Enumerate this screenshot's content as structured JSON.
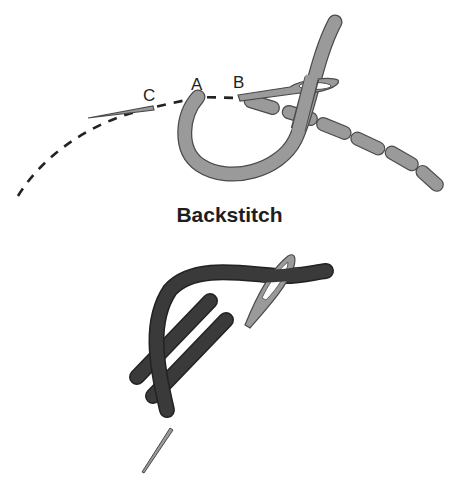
{
  "diagram": {
    "top_figure": {
      "point_labels": [
        "A",
        "B",
        "C"
      ],
      "caption": "Backstitch",
      "thread_color": "#9a9a9a",
      "outline_color": "#4a4a4a",
      "dash_color": "#222222"
    },
    "bottom_figure": {
      "thread_color": "#3a3a3a",
      "needle_color": "#9a9a9a"
    }
  }
}
